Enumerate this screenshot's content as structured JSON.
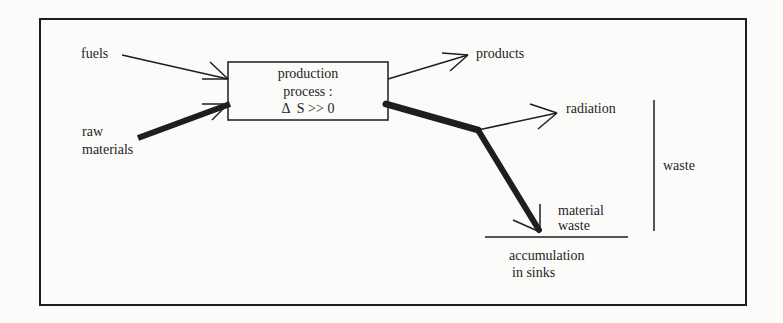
{
  "diagram": {
    "process_box": {
      "line1": "production",
      "line2": "process :",
      "line3": "Δ  S >> 0"
    },
    "inputs": {
      "fuels": "fuels",
      "raw_materials_line1": "raw",
      "raw_materials_line2": "materials"
    },
    "outputs": {
      "products": "products",
      "radiation": "radiation",
      "material_waste_line1": "material",
      "material_waste_line2": "waste",
      "waste": "waste",
      "accumulation_line1": "accumulation",
      "accumulation_line2": "in sinks"
    },
    "colors": {
      "ink": "#1e1e1e",
      "background": "#fbfbfa"
    }
  }
}
